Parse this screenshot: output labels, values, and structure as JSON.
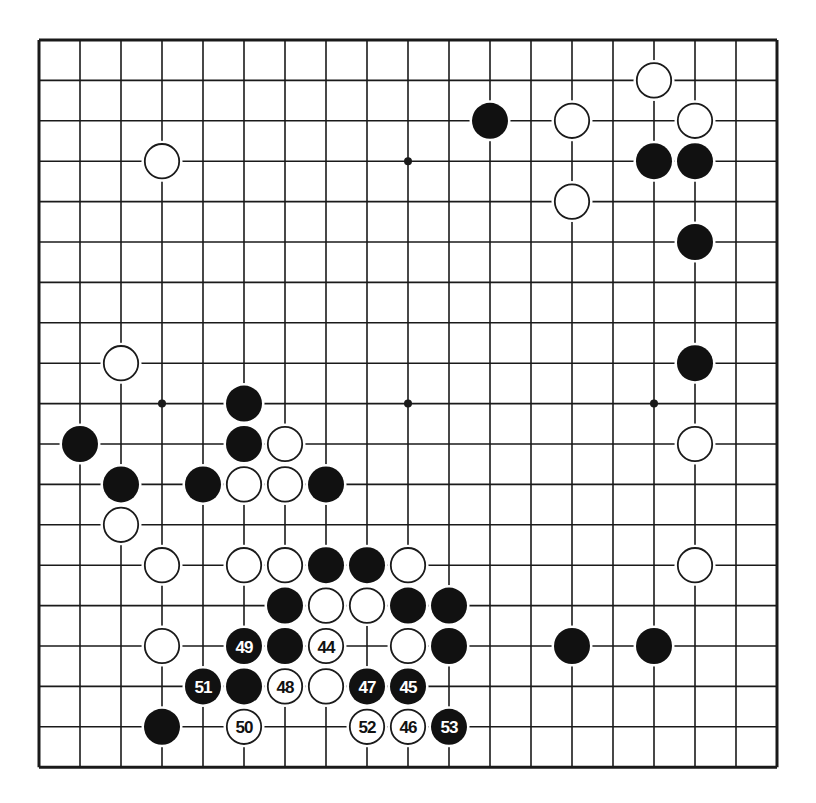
{
  "board": {
    "size": 19,
    "origin_x": 39,
    "origin_y": 40,
    "spacing_x": 41,
    "spacing_y": 40.4,
    "line_color": "#1a1a1a",
    "background": "#ffffff",
    "star_points": [
      [
        3,
        3
      ],
      [
        9,
        3
      ],
      [
        15,
        3
      ],
      [
        3,
        9
      ],
      [
        9,
        9
      ],
      [
        15,
        9
      ],
      [
        3,
        15
      ],
      [
        9,
        15
      ],
      [
        15,
        15
      ]
    ]
  },
  "stones": [
    {
      "color": "white",
      "col": 15,
      "row": 1
    },
    {
      "color": "black",
      "col": 11,
      "row": 2
    },
    {
      "color": "white",
      "col": 13,
      "row": 2
    },
    {
      "color": "white",
      "col": 16,
      "row": 2
    },
    {
      "color": "white",
      "col": 3,
      "row": 3
    },
    {
      "color": "black",
      "col": 15,
      "row": 3
    },
    {
      "color": "black",
      "col": 16,
      "row": 3
    },
    {
      "color": "white",
      "col": 13,
      "row": 4
    },
    {
      "color": "black",
      "col": 16,
      "row": 5
    },
    {
      "color": "white",
      "col": 2,
      "row": 8
    },
    {
      "color": "black",
      "col": 16,
      "row": 8
    },
    {
      "color": "black",
      "col": 5,
      "row": 9
    },
    {
      "color": "black",
      "col": 1,
      "row": 10
    },
    {
      "color": "black",
      "col": 5,
      "row": 10
    },
    {
      "color": "white",
      "col": 6,
      "row": 10
    },
    {
      "color": "white",
      "col": 16,
      "row": 10
    },
    {
      "color": "black",
      "col": 2,
      "row": 11
    },
    {
      "color": "black",
      "col": 4,
      "row": 11
    },
    {
      "color": "white",
      "col": 5,
      "row": 11
    },
    {
      "color": "white",
      "col": 6,
      "row": 11
    },
    {
      "color": "black",
      "col": 7,
      "row": 11
    },
    {
      "color": "white",
      "col": 2,
      "row": 12
    },
    {
      "color": "white",
      "col": 3,
      "row": 13
    },
    {
      "color": "white",
      "col": 5,
      "row": 13
    },
    {
      "color": "white",
      "col": 6,
      "row": 13
    },
    {
      "color": "black",
      "col": 7,
      "row": 13
    },
    {
      "color": "black",
      "col": 8,
      "row": 13
    },
    {
      "color": "white",
      "col": 9,
      "row": 13
    },
    {
      "color": "white",
      "col": 16,
      "row": 13
    },
    {
      "color": "black",
      "col": 6,
      "row": 14
    },
    {
      "color": "white",
      "col": 7,
      "row": 14
    },
    {
      "color": "white",
      "col": 8,
      "row": 14
    },
    {
      "color": "black",
      "col": 9,
      "row": 14
    },
    {
      "color": "black",
      "col": 10,
      "row": 14
    },
    {
      "color": "white",
      "col": 3,
      "row": 15
    },
    {
      "color": "black",
      "col": 5,
      "row": 15,
      "label": "49"
    },
    {
      "color": "black",
      "col": 6,
      "row": 15
    },
    {
      "color": "white",
      "col": 7,
      "row": 15,
      "label": "44"
    },
    {
      "color": "white",
      "col": 9,
      "row": 15
    },
    {
      "color": "black",
      "col": 10,
      "row": 15
    },
    {
      "color": "black",
      "col": 13,
      "row": 15
    },
    {
      "color": "black",
      "col": 15,
      "row": 15
    },
    {
      "color": "black",
      "col": 4,
      "row": 16,
      "label": "51"
    },
    {
      "color": "black",
      "col": 5,
      "row": 16
    },
    {
      "color": "white",
      "col": 6,
      "row": 16,
      "label": "48"
    },
    {
      "color": "white",
      "col": 7,
      "row": 16
    },
    {
      "color": "black",
      "col": 8,
      "row": 16,
      "label": "47"
    },
    {
      "color": "black",
      "col": 9,
      "row": 16,
      "label": "45"
    },
    {
      "color": "black",
      "col": 3,
      "row": 17
    },
    {
      "color": "white",
      "col": 5,
      "row": 17,
      "label": "50"
    },
    {
      "color": "white",
      "col": 8,
      "row": 17,
      "label": "52"
    },
    {
      "color": "white",
      "col": 9,
      "row": 17,
      "label": "46"
    },
    {
      "color": "black",
      "col": 10,
      "row": 17,
      "label": "53"
    }
  ]
}
